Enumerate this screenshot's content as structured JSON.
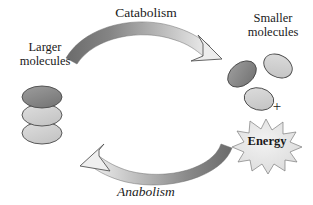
{
  "diagram": {
    "background_color": "#ffffff",
    "text_color": "#1a1a1a"
  },
  "labels": {
    "catabolism": "Catabolism",
    "anabolism": "Anabolism",
    "larger_molecules": "Larger\nmolecules",
    "smaller_molecules": "Smaller\nmolecules",
    "energy": "Energy",
    "plus": "+"
  },
  "colors": {
    "dark_gray": "#7c7c7c",
    "mid_gray": "#9a9a9a",
    "light_gray": "#cfcfcf",
    "pale_gray": "#e2e2e2",
    "outline": "#3a3a3a",
    "arrow_dark": "#6e6e6e",
    "arrow_light": "#e8e8e8"
  },
  "shapes": {
    "larger_molecule_stack": [
      {
        "name": "ellipse-top",
        "fill": "#8a8a8a",
        "cx": 42,
        "cy": 97,
        "rx": 20,
        "ry": 11,
        "rotate": 0
      },
      {
        "name": "ellipse-middle",
        "fill": "#cccccc",
        "cx": 42,
        "cy": 115,
        "rx": 20,
        "ry": 11,
        "rotate": 0
      },
      {
        "name": "ellipse-bottom",
        "fill": "#d4d4d4",
        "cx": 42,
        "cy": 133,
        "rx": 20,
        "ry": 11,
        "rotate": 0
      }
    ],
    "smaller_molecules": [
      {
        "name": "ellipse-dark",
        "fill": "#8a8a8a",
        "cx": 242,
        "cy": 74,
        "rx": 16,
        "ry": 11,
        "rotate": -38
      },
      {
        "name": "ellipse-light-upper",
        "fill": "#cdcdcd",
        "cx": 278,
        "cy": 66,
        "rx": 15,
        "ry": 11,
        "rotate": 28
      },
      {
        "name": "ellipse-light-lower",
        "fill": "#cdcdcd",
        "cx": 259,
        "cy": 99,
        "rx": 15,
        "ry": 11,
        "rotate": 14
      }
    ],
    "energy_burst": {
      "name": "starburst",
      "fill": "#e6e6e6",
      "cx": 266,
      "cy": 143,
      "points": 14,
      "outer_rx": 35,
      "outer_ry": 24,
      "inner_ratio": 0.62
    },
    "arrows": [
      {
        "name": "catabolism-arrow",
        "direction": "left-to-right",
        "gradient_from": "#6e6e6e",
        "gradient_to": "#ededed"
      },
      {
        "name": "anabolism-arrow",
        "direction": "right-to-left",
        "gradient_from": "#6e6e6e",
        "gradient_to": "#ededed"
      }
    ]
  }
}
